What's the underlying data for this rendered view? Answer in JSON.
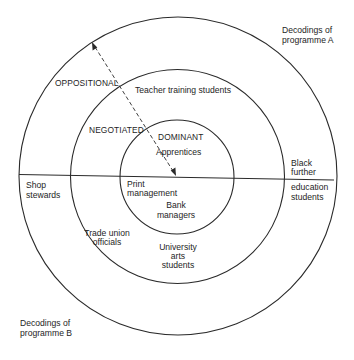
{
  "diagram": {
    "programme_a_label": [
      "Decodings of",
      "programme A"
    ],
    "programme_b_label": [
      "Decodings of",
      "programme B"
    ],
    "rings": [
      {
        "name": "dominant",
        "label": "DOMINANT",
        "cx": 177,
        "cy": 177,
        "r": 57
      },
      {
        "name": "negotiated",
        "label": "NEGOTIATED",
        "cx": 177.5,
        "cy": 176.5,
        "r": 107
      },
      {
        "name": "oppositional",
        "label": "OPPOSITIONAL",
        "cx": 178,
        "cy": 176,
        "r": 159
      }
    ],
    "divider": {
      "x1": 19,
      "y1": 174.5,
      "x2": 334,
      "y2": 180
    },
    "arrow": {
      "from": [
        92,
        42
      ],
      "to": [
        176,
        176
      ],
      "style": "dashed",
      "heads": "both"
    },
    "groups_programme_a": [
      {
        "label": [
          "Apprentices"
        ],
        "ring": "dominant"
      },
      {
        "label": [
          "Teacher training students"
        ],
        "ring": "negotiated"
      },
      {
        "label": [
          "Black",
          "further"
        ],
        "ring": "oppositional"
      }
    ],
    "groups_programme_b": [
      {
        "label": [
          "Print",
          "management"
        ],
        "ring": "dominant"
      },
      {
        "label": [
          "Bank",
          "managers"
        ],
        "ring": "dominant"
      },
      {
        "label": [
          "Trade union",
          "officials"
        ],
        "ring": "negotiated"
      },
      {
        "label": [
          "University",
          "arts",
          "students"
        ],
        "ring": "negotiated"
      },
      {
        "label": [
          "Shop",
          "stewards"
        ],
        "ring": "oppositional"
      },
      {
        "label": [
          "education",
          "students"
        ],
        "ring": "oppositional"
      }
    ],
    "colors": {
      "line": "#2a2a2a",
      "text": "#1e1e1e",
      "background": "#ffffff"
    }
  },
  "labels": {
    "dominant": "DOMINANT",
    "negotiated": "NEGOTIATED",
    "oppositional": "OPPOSITIONAL",
    "apprentices": "Apprentices",
    "teacher_training": "Teacher training students",
    "black": "Black",
    "further": "further",
    "education": "education",
    "students_edu": "students",
    "print": "Print",
    "management": "management",
    "bank": "Bank",
    "managers": "managers",
    "trade_union": "Trade union",
    "officials": "officials",
    "university": "University",
    "arts": "arts",
    "students_uni": "students",
    "shop": "Shop",
    "stewards": "stewards",
    "decodings_a_1": "Decodings of",
    "decodings_a_2": "programme A",
    "decodings_b_1": "Decodings of",
    "decodings_b_2": "programme B"
  }
}
